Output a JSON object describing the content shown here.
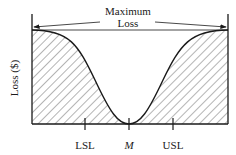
{
  "diagram": {
    "title_line1": "Maximum",
    "title_line2": "Loss",
    "y_axis_label": "Loss ($)",
    "ticks": [
      {
        "label": "LSL",
        "x": 85
      },
      {
        "label": "M",
        "x": 129
      },
      {
        "label": "USL",
        "x": 173
      }
    ],
    "colors": {
      "line": "#1a1a1a",
      "hatch": "#333333",
      "background": "#ffffff"
    }
  }
}
